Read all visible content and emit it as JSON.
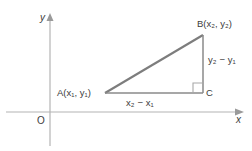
{
  "figure": {
    "kind": "coordinate-geometry-diagram",
    "background_color": "#ffffff",
    "width": 252,
    "height": 151
  },
  "axes": {
    "x_axis_label": "x",
    "y_axis_label": "y",
    "origin_label": "O",
    "axis_color": "#b4b4b4",
    "arrow_color": "#9a9a9a",
    "x_axis_y_px": 112,
    "y_axis_x_px": 50
  },
  "triangle": {
    "stroke_color": "#7d7d7d",
    "vertices": [
      {
        "id": "A",
        "label": "A(x₁, y₁)",
        "x_px": 105,
        "y_px": 93
      },
      {
        "id": "B",
        "label": "B(x₂, y₂)",
        "x_px": 203,
        "y_px": 35
      },
      {
        "id": "C",
        "label": "C",
        "x_px": 203,
        "y_px": 93
      }
    ],
    "right_angle_at": "C",
    "legs": {
      "horizontal_label": "x₂ − x₁",
      "vertical_label": "y₂ − y₁"
    }
  },
  "labels": {
    "point_a": "A(x₁, y₁)",
    "point_b": "B(x₂, y₂)",
    "point_c": "C",
    "leg_horizontal": "x₂ − x₁",
    "leg_vertical": "y₂ − y₁",
    "axis_x": "x",
    "axis_y": "y",
    "origin": "O"
  }
}
